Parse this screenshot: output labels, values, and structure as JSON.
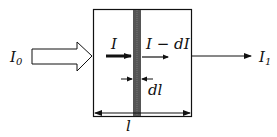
{
  "diagram": {
    "labels": {
      "incident": "I",
      "incident_sub": "0",
      "inside": "I",
      "after_layer": "I − dI",
      "layer_thickness": "dl",
      "slab_length": "l",
      "transmitted": "I",
      "transmitted_sub": "1"
    },
    "colors": {
      "line": "#111111",
      "layer": "#555555",
      "background": "#ffffff"
    }
  }
}
